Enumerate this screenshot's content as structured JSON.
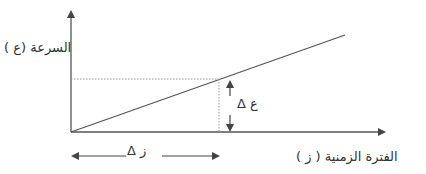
{
  "diagram": {
    "type": "velocity-time graph",
    "y_axis_label": "السرعة (ع )",
    "x_axis_label": "الفترة الزمنية ( ز )",
    "delta_velocity_label": "Δ ع",
    "delta_time_label": "Δ ز",
    "colors": {
      "line": "#555555",
      "dotted": "#999999",
      "text": "#333333"
    }
  }
}
